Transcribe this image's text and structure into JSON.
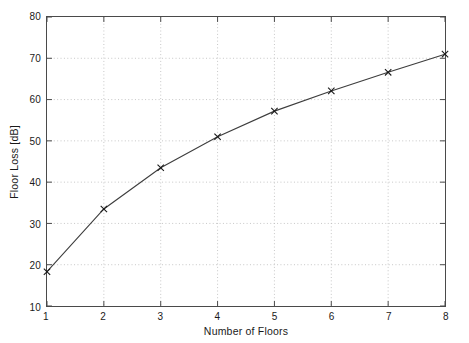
{
  "chart_data": {
    "type": "line",
    "title": "",
    "subtitle": "",
    "xlabel": "Number of Floors",
    "ylabel": "Floor Loss [dB]",
    "x": [
      1,
      2,
      3,
      4,
      5,
      6,
      7,
      8
    ],
    "values": [
      18.3,
      33.5,
      43.5,
      51.0,
      57.2,
      62.1,
      66.6,
      71.0
    ],
    "series": [
      {
        "name": "Floor Loss",
        "x": [
          1,
          2,
          3,
          4,
          5,
          6,
          7,
          8
        ],
        "values": [
          18.3,
          33.5,
          43.5,
          51.0,
          57.2,
          62.1,
          66.6,
          71.0
        ]
      }
    ],
    "xlim": [
      1,
      8
    ],
    "ylim": [
      10,
      80
    ],
    "xticks": [
      1,
      2,
      3,
      4,
      5,
      6,
      7,
      8
    ],
    "yticks": [
      10,
      20,
      30,
      40,
      50,
      60,
      70,
      80
    ],
    "xtick_labels": [
      "1",
      "2",
      "3",
      "4",
      "5",
      "6",
      "7",
      "8"
    ],
    "ytick_labels": [
      "10",
      "20",
      "30",
      "40",
      "50",
      "60",
      "70",
      "80"
    ],
    "grid": true,
    "grid_style": "dotted",
    "legend": null,
    "legend_position": "none",
    "marker": "x",
    "line_color": "#3d3d3d",
    "marker_color": "#1a1a1a",
    "grid_color": "#b8b8b8",
    "axis_color": "#4a4a4a",
    "background_color": "#ffffff",
    "annotations": []
  }
}
